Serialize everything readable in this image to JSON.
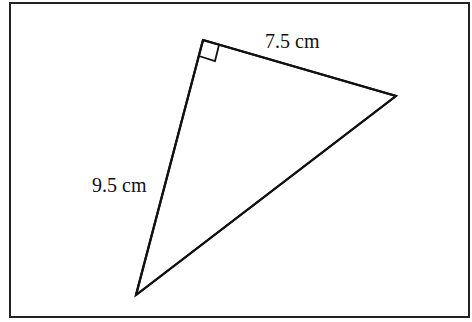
{
  "diagram": {
    "type": "right-triangle",
    "labels": {
      "top_side": "7.5 cm",
      "left_side": "9.5 cm"
    },
    "right_angle_marker": true,
    "stroke_color": "#111111",
    "border_color": "#222222"
  }
}
